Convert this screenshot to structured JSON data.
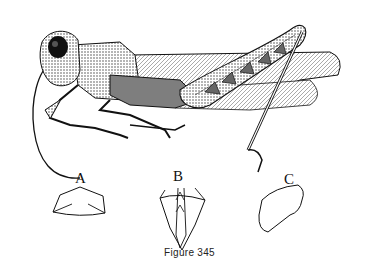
{
  "figure": {
    "caption": "Figure 345",
    "panels": [
      {
        "label": "A",
        "description": "pronotum outline"
      },
      {
        "label": "B",
        "description": "ventral view of abdomen tip"
      },
      {
        "label": "C",
        "description": "lobe outline"
      }
    ]
  }
}
